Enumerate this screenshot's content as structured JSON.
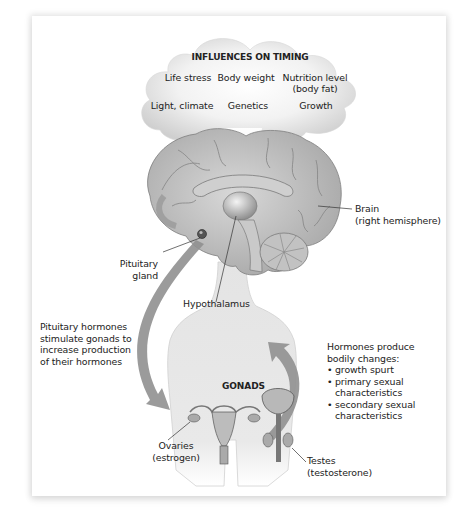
{
  "cloud": {
    "title": "INFLUENCES ON TIMING",
    "factors": [
      {
        "label": "Life stress"
      },
      {
        "label": "Body weight"
      },
      {
        "label": "Nutrition level",
        "sub": "(body fat)"
      },
      {
        "label": "Light, climate"
      },
      {
        "label": "Genetics"
      },
      {
        "label": "Growth"
      }
    ]
  },
  "labels": {
    "brain": {
      "line1": "Brain",
      "line2": "(right hemisphere)"
    },
    "pituitary": {
      "line1": "Pituitary",
      "line2": "gland"
    },
    "hypothalamus": "Hypothalamus",
    "pituitary_hormones": [
      "Pituitary hormones",
      "stimulate gonads to",
      "increase production",
      "of their hormones"
    ],
    "gonads": "GONADS",
    "hormones_produce": {
      "intro": [
        "Hormones produce",
        "bodily changes:"
      ],
      "items": [
        [
          "growth spurt"
        ],
        [
          "primary sexual",
          "characteristics"
        ],
        [
          "secondary sexual",
          "characteristics"
        ]
      ]
    },
    "ovaries": {
      "line1": "Ovaries",
      "line2": "(estrogen)"
    },
    "testes": {
      "line1": "Testes",
      "line2": "(testosterone)"
    }
  },
  "colors": {
    "cloud": "#d9d9d9",
    "brain": "#bdbdbd",
    "body": "#e6e6e6",
    "arrow": "#8c8c8c",
    "text": "#222222"
  }
}
